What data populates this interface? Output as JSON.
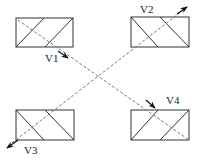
{
  "diagram": {
    "colors": {
      "stroke": "#333333",
      "dash": "#777777",
      "arrow": "#111111"
    },
    "labels": {
      "v1": "V1",
      "v2": "V2",
      "v3": "V3",
      "v4": "V4"
    },
    "boxes": [
      {
        "id": "top-left"
      },
      {
        "id": "top-right"
      },
      {
        "id": "bottom-left"
      },
      {
        "id": "bottom-right"
      }
    ]
  }
}
